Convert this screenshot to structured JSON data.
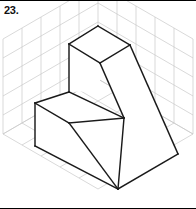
{
  "figure": {
    "problem_number": "23.",
    "background_color": "#ffffff",
    "grid_color": "#c9c9c9",
    "edge_color": "#1a1a1a",
    "face_color": "#ffffff",
    "border_color": "#000000",
    "canvas": {
      "width": 196,
      "height": 209
    },
    "grid": {
      "type": "isometric-three-plane",
      "cell_size": 19,
      "origin": {
        "x": 98,
        "y": 133
      },
      "left_plane_cells": 5,
      "right_plane_cells": 5,
      "floor_plane_cells": 5,
      "vertical_cells": 5
    },
    "solid": {
      "name": "stepped-block",
      "vertices": {
        "top_apex": {
          "x": 98,
          "y": 25
        },
        "top_left": {
          "x": 69,
          "y": 43
        },
        "top_right": {
          "x": 130,
          "y": 44
        },
        "top_inner": {
          "x": 100,
          "y": 62
        },
        "upper_left_lower": {
          "x": 69,
          "y": 91
        },
        "step_left": {
          "x": 35,
          "y": 102
        },
        "step_front": {
          "x": 69,
          "y": 122
        },
        "notch_corner": {
          "x": 124,
          "y": 117
        },
        "bottom_left": {
          "x": 35,
          "y": 145
        },
        "bottom_apex": {
          "x": 118,
          "y": 188
        },
        "bottom_right": {
          "x": 178,
          "y": 153
        }
      },
      "faces": [
        "top-face",
        "upper-front-left-face",
        "upper-front-right-face",
        "step-top-face",
        "lower-front-left-face",
        "right-side-face"
      ]
    }
  }
}
